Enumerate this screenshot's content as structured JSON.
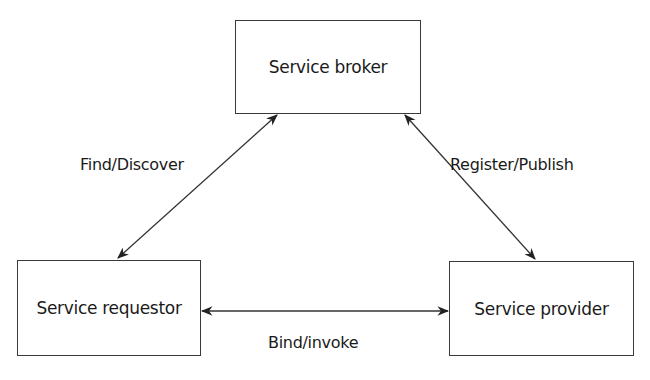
{
  "diagram": {
    "type": "service-oriented-architecture",
    "nodes": [
      {
        "id": "broker",
        "label": "Service broker"
      },
      {
        "id": "requestor",
        "label": "Service requestor"
      },
      {
        "id": "provider",
        "label": "Service provider"
      }
    ],
    "edges": [
      {
        "from": "requestor",
        "to": "broker",
        "label": "Find/Discover",
        "bidirectional": true
      },
      {
        "from": "broker",
        "to": "provider",
        "label": "Register/Publish",
        "bidirectional": true
      },
      {
        "from": "requestor",
        "to": "provider",
        "label": "Bind/invoke",
        "bidirectional": true
      }
    ]
  },
  "colors": {
    "stroke": "#3a3a3a",
    "text": "#1a1a1a",
    "background": "#ffffff"
  }
}
